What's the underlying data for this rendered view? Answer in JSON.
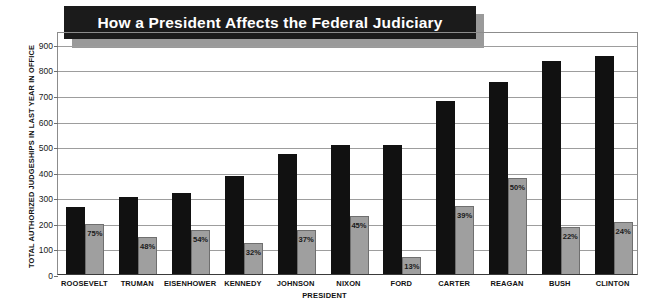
{
  "chart_data": {
    "type": "bar",
    "title": "How a President Affects the Federal Judiciary",
    "xlabel": "PRESIDENT",
    "ylabel": "TOTAL AUTHORIZED JUDGESHIPS IN LAST YEAR IN OFFICE",
    "categories": [
      "ROOSEVELT",
      "TRUMAN",
      "EISENHOWER",
      "KENNEDY",
      "JOHNSON",
      "NIXON",
      "FORD",
      "CARTER",
      "REAGAN",
      "BUSH",
      "CLINTON"
    ],
    "ylim": [
      0,
      950
    ],
    "yticks": [
      0,
      100,
      200,
      300,
      400,
      500,
      600,
      700,
      800,
      900
    ],
    "ytick_labels": [
      "0",
      "100",
      "200",
      "300",
      "400",
      "500",
      "600",
      "700",
      "800",
      "900"
    ],
    "grid": true,
    "legend": "none",
    "series": [
      {
        "name": "Total authorized judgeships in last year in office",
        "color": "#111111",
        "values": [
          262,
          300,
          318,
          384,
          468,
          504,
          504,
          677,
          752,
          832,
          852
        ]
      },
      {
        "name": "Judgeships filled by the president's appointees",
        "color": "#9f9f9f",
        "values": [
          197,
          144,
          172,
          123,
          173,
          227,
          66,
          264,
          376,
          183,
          204
        ],
        "data_labels": [
          "75%",
          "48%",
          "54%",
          "32%",
          "37%",
          "45%",
          "13%",
          "39%",
          "50%",
          "22%",
          "24%"
        ]
      }
    ],
    "annotations": []
  },
  "colors": {
    "title_box": "#1b1b1b",
    "title_shadow": "#9a9a9a",
    "title_text": "#ffffff",
    "dark_bar": "#111111",
    "light_bar": "#9f9f9f",
    "gridline": "#9d9d9d",
    "axis": "#3a3a3a",
    "background": "#ffffff"
  }
}
